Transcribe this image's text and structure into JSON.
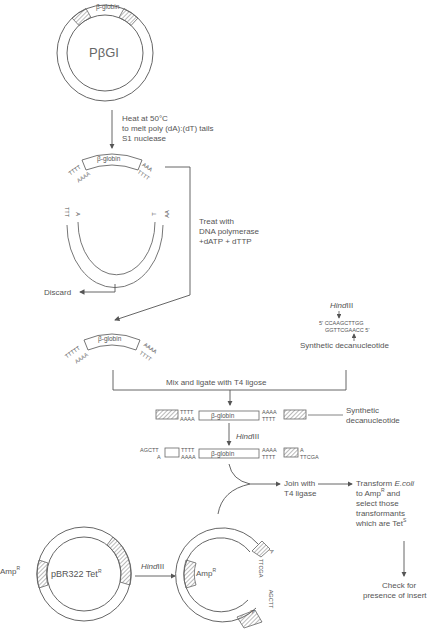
{
  "diagram": {
    "type": "flowchart",
    "colors": {
      "line": "#666666",
      "text": "#555555",
      "background": "#ffffff"
    }
  },
  "plasmid_top": {
    "name": "PβGI",
    "insert_label": "β-globin"
  },
  "step1": {
    "line1": "Heat at 50°C",
    "line2": "to melt poly (dA):(dT) tails",
    "line3": "S1 nuclease"
  },
  "fragment1": {
    "insert_label": "β-globin",
    "left_top": "TTTT",
    "left_bottom": "AAAA",
    "right_top": "AAA",
    "right_bottom": "TTTT"
  },
  "vector_fragment": {
    "left_outer": "TTT",
    "left_inner": "A",
    "right_inner": "T",
    "right_outer": "AA"
  },
  "discard_label": "Discard",
  "step2": {
    "line1": "Treat with",
    "line2": "DNA polymerase",
    "line3": "+dATP + dTTP"
  },
  "fragment2": {
    "insert_label": "β-globin",
    "left_top": "TTTTT",
    "left_bottom": "AAAA",
    "right_top": "AAAA",
    "right_bottom": "TTTT"
  },
  "linker": {
    "enzyme": "Hind",
    "enzyme_numeral": "III",
    "top_strand": "5' CCAAGCTTGG",
    "bottom_strand": "GGTTCGAACC 5'",
    "label": "Synthetic decanucleotide"
  },
  "step3": {
    "label": "Mix and ligate with T4 ligose"
  },
  "ligated": {
    "insert_label": "β-globin",
    "left_top": "TTTT",
    "left_bottom": "AAAA",
    "right_top": "AAAA",
    "right_bottom": "TTTT",
    "callout_line1": "Synthetic",
    "callout_line2": "decanucleotide"
  },
  "step4": {
    "enzyme": "Hind",
    "enzyme_numeral": "III"
  },
  "digested": {
    "insert_label": "β-globin",
    "far_left_top": "AGCTT",
    "far_left_bottom": "A",
    "left_top": "TTTT",
    "left_bottom": "AAAA",
    "right_top": "AAAA",
    "right_bottom": "TTTT",
    "far_right_top": "A",
    "far_right_bottom": "TTCGA"
  },
  "step5": {
    "line1": "Join with",
    "line2": "T4 ligase"
  },
  "step6": {
    "line1_a": "Transform ",
    "line1_b": "E.coli",
    "line2": "to Amp",
    "line2_sup": "R",
    "line2_b": " and",
    "line3": "select those",
    "line4": "transformants",
    "line5": "which are Tet",
    "line5_sup": "S"
  },
  "step7": {
    "line1": "Check for",
    "line2": "presence of insert"
  },
  "pbr322": {
    "name": "pBR322 Tet",
    "name_sup": "R",
    "outer_label": "Amp",
    "outer_label_sup": "R"
  },
  "step_pbr_cut": {
    "enzyme": "Hind",
    "enzyme_numeral": "III"
  },
  "cut_vector": {
    "label": "Amp",
    "label_sup": "R",
    "end1_a": "A",
    "end1_b": "TTCGA",
    "end2_a": "AGCTT",
    "end2_b": "A"
  }
}
